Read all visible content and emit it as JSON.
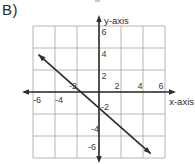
{
  "label": "B)",
  "colors": {
    "background": "#ffffff",
    "grid": "#a3a3a3",
    "axis": "#2e2e2e",
    "line": "#2e2e2e",
    "text": "#3b3b3b"
  },
  "chart_data": {
    "type": "line",
    "title": "",
    "xlabel": "x-axis",
    "ylabel": "y-axis",
    "xlim": [
      -7,
      7
    ],
    "ylim": [
      -7,
      7
    ],
    "grid": true,
    "grid_range": [
      -6,
      6
    ],
    "grid_step": 2,
    "x_ticks": [
      -6,
      -4,
      -2,
      2,
      4,
      6
    ],
    "y_ticks": [
      6,
      4,
      2,
      -2,
      -4,
      -6
    ],
    "line": {
      "endpoints": [
        [
          -5.5,
          3.4
        ],
        [
          4.7,
          -5.6
        ]
      ],
      "slope": -0.87,
      "x_intercept": -1.7,
      "y_intercept": -1.5,
      "arrowheads": "both ends"
    }
  }
}
